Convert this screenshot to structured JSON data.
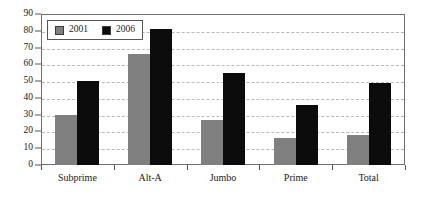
{
  "chart_data": {
    "type": "bar",
    "title": "",
    "subtitle": "",
    "xlabel": "",
    "ylabel": "",
    "categories": [
      "Subprime",
      "Alt-A",
      "Jumbo",
      "Prime",
      "Total"
    ],
    "series": [
      {
        "name": "2001",
        "color": "#808080",
        "values": [
          30,
          66,
          27,
          16,
          18
        ]
      },
      {
        "name": "2006",
        "color": "#0c0c0c",
        "values": [
          50,
          81,
          55,
          36,
          49
        ]
      }
    ],
    "ylim": [
      0,
      90
    ],
    "ytick_step": 10,
    "yticks": [
      0,
      10,
      20,
      30,
      40,
      50,
      60,
      70,
      80,
      90
    ],
    "ytick_labels": [
      "0",
      "10",
      "20",
      "30",
      "40",
      "50",
      "60",
      "70",
      "80",
      "90"
    ],
    "grid": "horizontal-dashed",
    "legend_position": "top-left-inside",
    "legend_entries": [
      "2001",
      "2006"
    ],
    "annotations": []
  }
}
